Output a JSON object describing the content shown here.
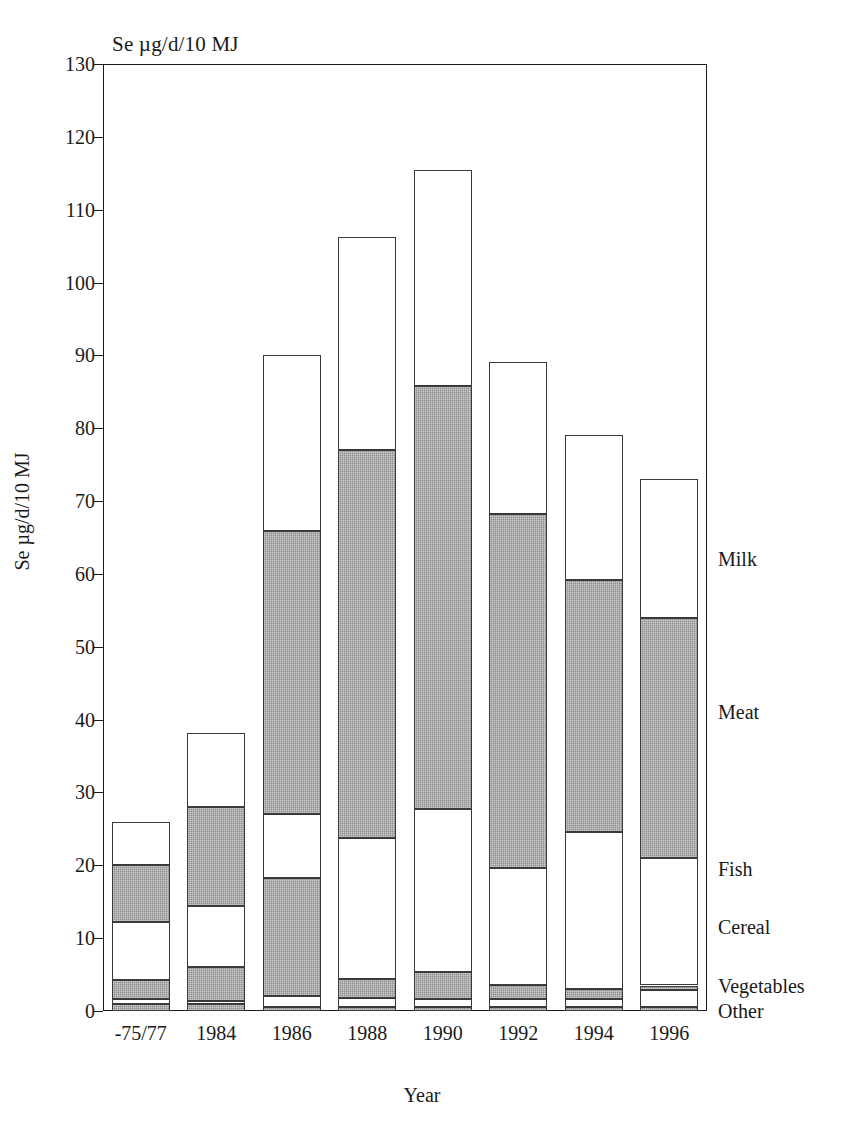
{
  "chart_data": {
    "type": "bar",
    "stacked": true,
    "title": "Se µg/d/10 MJ",
    "xlabel": "Year",
    "ylabel": "Se µg/d/10 MJ",
    "ylim": [
      0,
      130
    ],
    "ytick_step": 10,
    "yticks": [
      0,
      10,
      20,
      30,
      40,
      50,
      60,
      70,
      80,
      90,
      100,
      110,
      120,
      130
    ],
    "grid": false,
    "legend_position": "right-outside-stack-order",
    "categories": [
      "-75/77",
      "1984",
      "1986",
      "1988",
      "1990",
      "1992",
      "1994",
      "1996"
    ],
    "series": [
      {
        "name": "Other",
        "fill": "gray",
        "values": [
          1.0,
          1.0,
          0.5,
          0.6,
          0.6,
          0.6,
          0.6,
          0.6
        ]
      },
      {
        "name": "Vegetables",
        "fill": "white",
        "values": [
          0.6,
          0.4,
          1.5,
          1.2,
          1.1,
          1.0,
          1.1,
          2.3
        ]
      },
      {
        "name": "Cereal",
        "fill": "gray",
        "values": [
          2.6,
          4.6,
          16.2,
          2.6,
          3.7,
          2.0,
          1.3,
          0.6
        ]
      },
      {
        "name": "Fish",
        "fill": "white",
        "values": [
          8.0,
          8.4,
          8.9,
          19.3,
          22.3,
          16.0,
          21.6,
          17.5
        ]
      },
      {
        "name": "Meat",
        "fill": "gray",
        "values": [
          7.8,
          13.6,
          38.8,
          53.3,
          58.1,
          48.6,
          34.6,
          32.9
        ]
      },
      {
        "name": "Milk",
        "fill": "white",
        "values": [
          5.9,
          10.2,
          24.1,
          29.2,
          29.7,
          20.9,
          19.9,
          19.1
        ]
      }
    ],
    "totals": [
      25.9,
      38.2,
      90.0,
      106.2,
      115.5,
      89.1,
      79.1,
      73.0
    ],
    "legend_entries": [
      {
        "label": "Milk",
        "y_value": 62.0
      },
      {
        "label": "Meat",
        "y_value": 41.0
      },
      {
        "label": "Fish",
        "y_value": 19.5
      },
      {
        "label": "Cereal",
        "y_value": 11.5
      },
      {
        "label": "Vegetables",
        "y_value": 3.5
      },
      {
        "label": "Other",
        "y_value": 0.0
      }
    ]
  },
  "colors": {
    "axis": "#1a1a1a",
    "segment_gray": "#8e8e8e",
    "segment_white": "#ffffff",
    "background": "#ffffff"
  }
}
